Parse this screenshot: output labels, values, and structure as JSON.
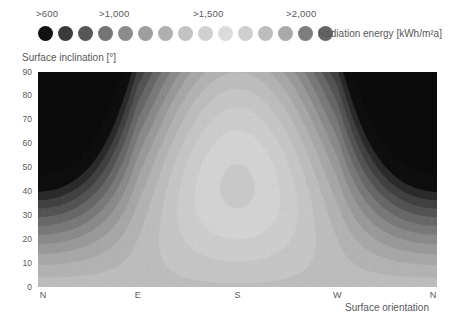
{
  "legend": {
    "title": "Radiation energy [kWh/m²a]",
    "ticks": [
      {
        "label": ">600",
        "x": 36
      },
      {
        "label": ">1,000",
        "x": 99
      },
      {
        "label": ">1,500",
        "x": 193
      },
      {
        "label": ">2,000",
        "x": 286
      }
    ],
    "dots": [
      {
        "color": "#111111",
        "x": 38
      },
      {
        "color": "#3a3a3a",
        "x": 58
      },
      {
        "color": "#565656",
        "x": 78
      },
      {
        "color": "#747474",
        "x": 98
      },
      {
        "color": "#8b8b8b",
        "x": 118
      },
      {
        "color": "#9e9e9e",
        "x": 138
      },
      {
        "color": "#b0b0b0",
        "x": 158
      },
      {
        "color": "#c2c2c2",
        "x": 178
      },
      {
        "color": "#d0d0d0",
        "x": 198
      },
      {
        "color": "#dcdcdc",
        "x": 218
      },
      {
        "color": "#cfcfcf",
        "x": 238
      },
      {
        "color": "#bdbdbd",
        "x": 258
      },
      {
        "color": "#a9a9a9",
        "x": 278
      },
      {
        "color": "#7d7d7d",
        "x": 298
      },
      {
        "color": "#666666",
        "x": 318
      }
    ]
  },
  "axes": {
    "y_title": "Surface inclination [°]",
    "x_title": "Surface orientation",
    "y_ticks": [
      "90",
      "80",
      "70",
      "60",
      "50",
      "40",
      "30",
      "20",
      "10",
      "0"
    ],
    "x_ticks": [
      "N",
      "E",
      "S",
      "W",
      "N"
    ]
  },
  "chart_data": {
    "type": "heatmap",
    "title": "Radiation energy [kWh/m²a]",
    "xlabel": "Surface orientation",
    "ylabel": "Surface inclination [°]",
    "xlim": [
      0,
      360
    ],
    "ylim": [
      0,
      90
    ],
    "x_tick_values": [
      0,
      90,
      180,
      270,
      360
    ],
    "x_tick_labels": [
      "N",
      "E",
      "S",
      "W",
      "N"
    ],
    "y_tick_values": [
      0,
      10,
      20,
      30,
      40,
      50,
      60,
      70,
      80,
      90
    ],
    "grid": false,
    "legend_position": "top",
    "colormap": "grayscale-dark-to-light-to-dark",
    "units": "kWh/m²a",
    "contour_levels": [
      600,
      800,
      1000,
      1100,
      1200,
      1300,
      1400,
      1500,
      1600,
      1700,
      1800,
      1900,
      2000,
      2100
    ],
    "level_colors": [
      "#111111",
      "#3a3a3a",
      "#565656",
      "#747474",
      "#8b8b8b",
      "#9e9e9e",
      "#b0b0b0",
      "#c2c2c2",
      "#d0d0d0",
      "#dcdcdc",
      "#cfcfcf",
      "#bdbdbd",
      "#a9a9a9",
      "#7d7d7d",
      "#666666"
    ],
    "samples": [
      {
        "orientation": "N",
        "inclination": 90,
        "value": 500
      },
      {
        "orientation": "N",
        "inclination": 60,
        "value": 620
      },
      {
        "orientation": "N",
        "inclination": 30,
        "value": 1050
      },
      {
        "orientation": "N",
        "inclination": 0,
        "value": 1750
      },
      {
        "orientation": "E",
        "inclination": 90,
        "value": 1000
      },
      {
        "orientation": "E",
        "inclination": 60,
        "value": 1300
      },
      {
        "orientation": "E",
        "inclination": 30,
        "value": 1620
      },
      {
        "orientation": "E",
        "inclination": 0,
        "value": 1750
      },
      {
        "orientation": "S",
        "inclination": 90,
        "value": 1500
      },
      {
        "orientation": "S",
        "inclination": 60,
        "value": 1950
      },
      {
        "orientation": "S",
        "inclination": 35,
        "value": 2150
      },
      {
        "orientation": "S",
        "inclination": 0,
        "value": 1750
      },
      {
        "orientation": "W",
        "inclination": 90,
        "value": 1000
      },
      {
        "orientation": "W",
        "inclination": 60,
        "value": 1300
      },
      {
        "orientation": "W",
        "inclination": 30,
        "value": 1620
      },
      {
        "orientation": "W",
        "inclination": 0,
        "value": 1750
      }
    ],
    "bands": [
      {
        "level": 600,
        "color": "#111111"
      },
      {
        "level": 800,
        "color": "#2d2d2d"
      },
      {
        "level": 900,
        "color": "#434343"
      },
      {
        "level": 1000,
        "color": "#565656"
      },
      {
        "level": 1100,
        "color": "#696969"
      },
      {
        "level": 1200,
        "color": "#7b7b7b"
      },
      {
        "level": 1300,
        "color": "#8c8c8c"
      },
      {
        "level": 1400,
        "color": "#9b9b9b"
      },
      {
        "level": 1500,
        "color": "#a8a8a8"
      },
      {
        "level": 1600,
        "color": "#b3b3b3"
      },
      {
        "level": 1700,
        "color": "#bdbdbd"
      },
      {
        "level": 1800,
        "color": "#c6c6c6"
      },
      {
        "level": 1900,
        "color": "#cdcdcd"
      },
      {
        "level": 2000,
        "color": "#d3d3d3"
      },
      {
        "level": 2100,
        "color": "#c9c9c9"
      }
    ]
  },
  "plot_geometry": {
    "width": 399,
    "height": 215,
    "background": "#0b0b0b"
  }
}
